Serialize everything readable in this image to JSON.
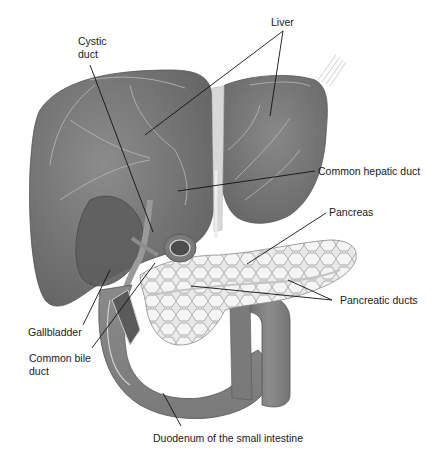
{
  "diagram": {
    "type": "anatomical illustration",
    "colors": {
      "background": "#ffffff",
      "organ_dark": "#6e6e6e",
      "organ_mid": "#8a8a8a",
      "organ_light": "#a8a8a8",
      "pancreas_fill": "#e6e6e6",
      "pancreas_cells": "#9a9a9a",
      "leader_line": "#111111",
      "label_text": "#1a1a1a"
    },
    "labels": {
      "liver": "Liver",
      "cystic_duct_line1": "Cystic",
      "cystic_duct_line2": "duct",
      "common_hepatic_duct": "Common hepatic duct",
      "pancreas": "Pancreas",
      "pancreatic_ducts": "Pancreatic ducts",
      "gallbladder": "Gallbladder",
      "common_bile_duct_line1": "Common bile",
      "common_bile_duct_line2": "duct",
      "duodenum": "Duodenum of the small intestine"
    }
  }
}
